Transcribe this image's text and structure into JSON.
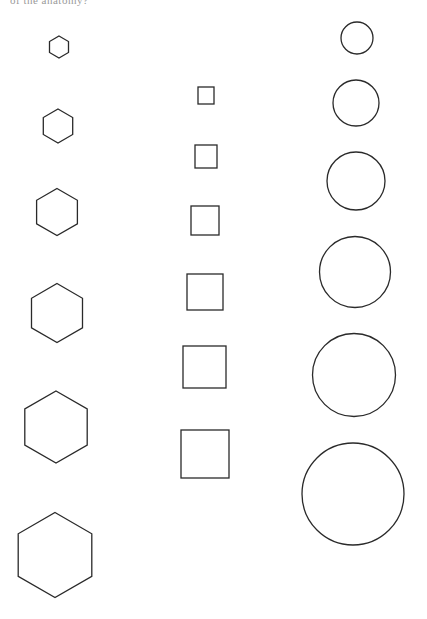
{
  "header": {
    "cropped_text": "of the anatomy?"
  },
  "stroke_color": "#2a2a2a",
  "background": "#ffffff",
  "columns": [
    {
      "name": "hexagons",
      "shapes": [
        {
          "cx": 59,
          "cy": 47,
          "r": 11
        },
        {
          "cx": 58,
          "cy": 126,
          "r": 17
        },
        {
          "cx": 57,
          "cy": 212,
          "r": 23.5
        },
        {
          "cx": 57,
          "cy": 313,
          "r": 29.5
        },
        {
          "cx": 56,
          "cy": 427,
          "r": 36
        },
        {
          "cx": 55,
          "cy": 555,
          "r": 42.5
        }
      ]
    },
    {
      "name": "squares",
      "shapes": [
        {
          "x": 198,
          "y": 87,
          "w": 16,
          "h": 17
        },
        {
          "x": 195,
          "y": 145,
          "w": 22,
          "h": 23
        },
        {
          "x": 191,
          "y": 206,
          "w": 28,
          "h": 29
        },
        {
          "x": 187,
          "y": 274,
          "w": 36,
          "h": 36
        },
        {
          "x": 183,
          "y": 346,
          "w": 43,
          "h": 42
        },
        {
          "x": 181,
          "y": 430,
          "w": 48,
          "h": 48
        }
      ]
    },
    {
      "name": "circles",
      "shapes": [
        {
          "cx": 357,
          "cy": 38,
          "r": 16
        },
        {
          "cx": 356,
          "cy": 103,
          "r": 23
        },
        {
          "cx": 356,
          "cy": 181,
          "r": 29
        },
        {
          "cx": 355,
          "cy": 272,
          "r": 35.5
        },
        {
          "cx": 354,
          "cy": 375,
          "r": 41.5
        },
        {
          "cx": 353,
          "cy": 494,
          "r": 51
        }
      ]
    }
  ]
}
